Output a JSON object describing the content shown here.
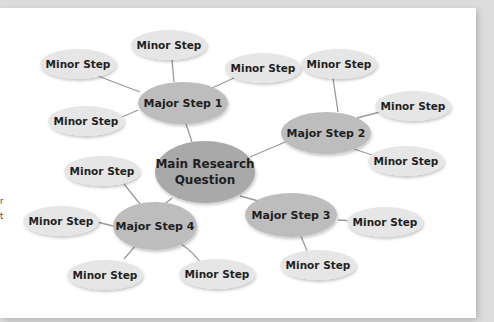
{
  "diagram": {
    "type": "mind-map",
    "colors": {
      "background_panel": "#ffffff",
      "frame": "#dcdcdc",
      "main_fill": "#a9a9a9",
      "major_fill": "#bdbdbd",
      "minor_fill": "#e6e6e6",
      "connector": "#9a9a9a",
      "text": "#1f1f1f"
    },
    "main": {
      "label_line1": "Main Research",
      "label_line2": "Question"
    },
    "majors": [
      {
        "label": "Major Step 1"
      },
      {
        "label": "Major Step 2"
      },
      {
        "label": "Major Step 3"
      },
      {
        "label": "Major Step 4"
      }
    ],
    "minors": [
      {
        "label": "Minor Step",
        "parent": "Major Step 1"
      },
      {
        "label": "Minor Step",
        "parent": "Major Step 1"
      },
      {
        "label": "Minor Step",
        "parent": "Major Step 1"
      },
      {
        "label": "Minor Step",
        "parent": "Major Step 1"
      },
      {
        "label": "Minor Step",
        "parent": "Major Step 2"
      },
      {
        "label": "Minor Step",
        "parent": "Major Step 2"
      },
      {
        "label": "Minor Step",
        "parent": "Major Step 2"
      },
      {
        "label": "Minor Step",
        "parent": "Major Step 3"
      },
      {
        "label": "Minor Step",
        "parent": "Major Step 3"
      },
      {
        "label": "Minor Step",
        "parent": "Major Step 4"
      },
      {
        "label": "Minor Step",
        "parent": "Major Step 4"
      },
      {
        "label": "Minor Step",
        "parent": "Major Step 4"
      },
      {
        "label": "Minor Step",
        "parent": "Major Step 4"
      }
    ]
  },
  "side_fragments": [
    "r",
    "t"
  ]
}
